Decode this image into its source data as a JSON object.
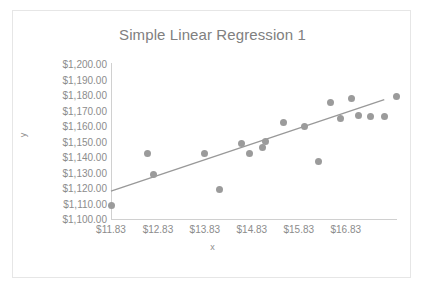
{
  "chart_data": {
    "type": "scatter",
    "title": "Simple Linear Regression 1",
    "xlabel": "x",
    "ylabel": "y",
    "grid": false,
    "legend": false,
    "legend_position": "none",
    "xlim": [
      11.83,
      17.9
    ],
    "ylim": [
      1100,
      1200
    ],
    "x_tick_labels": [
      "$11.83",
      "$12.83",
      "$13.83",
      "$14.83",
      "$15.83",
      "$16.83"
    ],
    "x_tick_values": [
      11.83,
      12.83,
      13.83,
      14.83,
      15.83,
      16.83
    ],
    "y_tick_labels": [
      "$1,200.00",
      "$1,190.00",
      "$1,180.00",
      "$1,170.00",
      "$1,160.00",
      "$1,150.00",
      "$1,140.00",
      "$1,130.00",
      "$1,120.00",
      "$1,110.00",
      "$1,100.00"
    ],
    "y_tick_values": [
      1200,
      1190,
      1180,
      1170,
      1160,
      1150,
      1140,
      1130,
      1120,
      1110,
      1100
    ],
    "series": [
      {
        "name": "y",
        "marker": "circle",
        "color": "#9b9b9b",
        "points": [
          {
            "x": 11.83,
            "y": 1109
          },
          {
            "x": 12.6,
            "y": 1142
          },
          {
            "x": 12.73,
            "y": 1129
          },
          {
            "x": 13.83,
            "y": 1142
          },
          {
            "x": 14.15,
            "y": 1119
          },
          {
            "x": 14.6,
            "y": 1149
          },
          {
            "x": 14.77,
            "y": 1142
          },
          {
            "x": 15.05,
            "y": 1146
          },
          {
            "x": 15.12,
            "y": 1150
          },
          {
            "x": 15.5,
            "y": 1162
          },
          {
            "x": 15.95,
            "y": 1160
          },
          {
            "x": 16.25,
            "y": 1137
          },
          {
            "x": 16.5,
            "y": 1175
          },
          {
            "x": 16.72,
            "y": 1165
          },
          {
            "x": 16.95,
            "y": 1178
          },
          {
            "x": 17.1,
            "y": 1167
          },
          {
            "x": 17.35,
            "y": 1166
          },
          {
            "x": 17.65,
            "y": 1166
          },
          {
            "x": 17.9,
            "y": 1179
          }
        ]
      }
    ],
    "trendline": {
      "name": "Linear trendline",
      "color": "#999999",
      "x_start": 11.83,
      "y_start": 1118,
      "x_end": 17.65,
      "y_end": 1177
    }
  }
}
